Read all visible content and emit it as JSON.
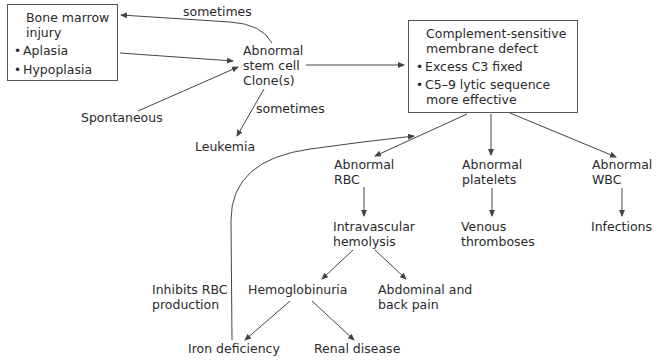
{
  "diagram": {
    "bone_marrow_box": {
      "title_lines": [
        "Bone marrow",
        "injury"
      ],
      "bullets": [
        "Aplasia",
        "Hypoplasia"
      ]
    },
    "complement_box": {
      "title_lines": [
        "Complement-sensitive",
        "membrane defect"
      ],
      "bullets": [
        "Excess C3 fixed",
        "C5–9 lytic sequence"
      ],
      "bullet_continuation": "more effective"
    },
    "nodes": {
      "stem_cell": [
        "Abnormal",
        "stem cell",
        "Clone(s)"
      ],
      "spontaneous": "Spontaneous",
      "leukemia": "Leukemia",
      "abnormal_rbc": [
        "Abnormal",
        "RBC"
      ],
      "abnormal_platelets": [
        "Abnormal",
        "platelets"
      ],
      "abnormal_wbc": [
        "Abnormal",
        "WBC"
      ],
      "intravascular_hemolysis": [
        "Intravascular",
        "hemolysis"
      ],
      "venous_thromboses": [
        "Venous",
        "thromboses"
      ],
      "infections": "Infections",
      "hemoglobinuria": "Hemoglobinuria",
      "abdominal_back_pain": [
        "Abdominal and",
        "back pain"
      ],
      "inhibits_rbc": [
        "Inhibits RBC",
        "production"
      ],
      "iron_deficiency": "Iron deficiency",
      "renal_disease": "Renal disease"
    },
    "edge_labels": {
      "sometimes_top": "sometimes",
      "sometimes_leukemia": "sometimes"
    },
    "colors": {
      "line": "#444444",
      "text": "#2a2a2a",
      "box_border": "#555555"
    }
  }
}
